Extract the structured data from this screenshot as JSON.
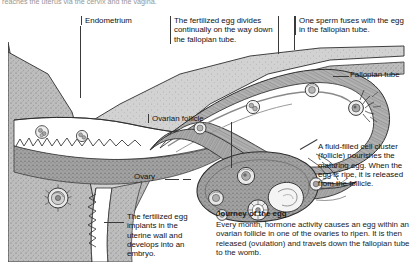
{
  "page": {
    "running_head": "reaches the uterus via the cervix and the vagina.",
    "background": "#ffffff",
    "ink": "#1a1a1a"
  },
  "callouts": {
    "endometrium": "Endometrium",
    "egg_divides": "The fertilized egg divides continually on the way down the fallopian tube.",
    "sperm_fuses": "One sperm fuses with the egg in the fallopian tube.",
    "fallopian_tube": "Fallopian tube",
    "ovarian_follicle": "Ovarian follicle",
    "ovary": "Ovary",
    "fluid_filled": "A fluid-filled cell cluster (follicle) nourishes the maturing egg. When the egg is ripe, it is released from the follicle.",
    "egg_implants": "The fertilized egg implants in the uterine wall and develops into an embryo."
  },
  "journey": {
    "title": "Journey of the egg",
    "body": "Every month, hormone activity causes an egg within an ovarian follicle in one of the ovaries to ripen. It is then released (ovulation) and travels down the fallopian tube to the womb."
  },
  "illustration": {
    "name": "uterus-fallopian-tube-ovary-cross-section",
    "style": "grayscale stippled engraving",
    "tones": {
      "myometrium": "#b9b9b9",
      "endometrium": "#9a9a9a",
      "lumen": "#ffffff",
      "tube_wall": "#a8a8a8",
      "ovary_body": "#909090",
      "outline": "#2e2e2e"
    },
    "structures": [
      "uterine wall (myometrium)",
      "endometrial lining with villous surface",
      "uterine cavity",
      "fallopian tube curving to the right",
      "fimbriae",
      "ovary with maturing follicles",
      "corpus luteum",
      "released egg (ovum)",
      "dividing fertilized egg stages"
    ]
  }
}
